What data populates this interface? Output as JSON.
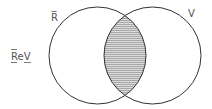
{
  "diagram": {
    "type": "venn",
    "sets": [
      {
        "label": "R̅",
        "name": "not-R"
      },
      {
        "label": "V",
        "name": "V"
      }
    ],
    "region_label": "ReV",
    "shaded_region": "intersection",
    "colors": {
      "stroke": "#333333",
      "hatch": "#888888",
      "fill": "#d9d9d9",
      "label": "#555555"
    }
  }
}
